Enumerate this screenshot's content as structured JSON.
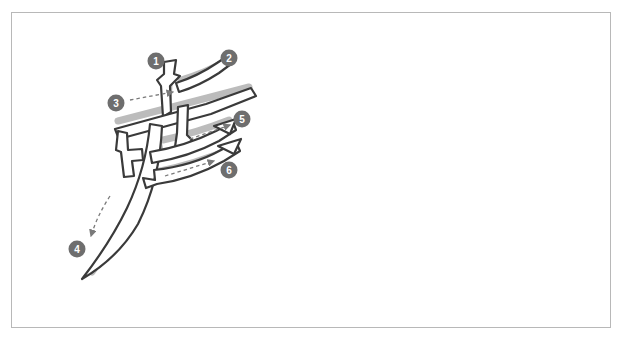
{
  "page": {
    "background_color": "#ffffff",
    "frame": {
      "border_color": "#b8b8b8",
      "fill_color": "#ffffff",
      "x": 11,
      "y": 12,
      "width": 600,
      "height": 316
    }
  },
  "diagram": {
    "type": "stroke-order-diagram",
    "character_form": "brush-outline calligraphic glyph",
    "stroke_count": 6,
    "stroke_outline_color": "#3a3a3a",
    "stroke_fill_color": "#ffffff",
    "stroke_shadow_color": "#9a9a9a",
    "arrow_color": "#7a7a7a",
    "arrow_style": "dashed",
    "markers": [
      {
        "id": "marker-1",
        "label": "1",
        "cx": 156,
        "cy": 61,
        "color": "#6e6e6e",
        "text_color": "#ffffff"
      },
      {
        "id": "marker-2",
        "label": "2",
        "cx": 229,
        "cy": 58,
        "color": "#6e6e6e",
        "text_color": "#ffffff"
      },
      {
        "id": "marker-3",
        "label": "3",
        "cx": 116,
        "cy": 103,
        "color": "#6e6e6e",
        "text_color": "#ffffff"
      },
      {
        "id": "marker-4",
        "label": "4",
        "cx": 77,
        "cy": 249,
        "color": "#6e6e6e",
        "text_color": "#ffffff"
      },
      {
        "id": "marker-5",
        "label": "5",
        "cx": 242,
        "cy": 119,
        "color": "#6e6e6e",
        "text_color": "#ffffff"
      },
      {
        "id": "marker-6",
        "label": "6",
        "cx": 229,
        "cy": 170,
        "color": "#6e6e6e",
        "text_color": "#ffffff"
      }
    ],
    "arrows": [
      {
        "id": "arrow-3",
        "from_x": 131,
        "from_y": 100,
        "to_x": 176,
        "to_y": 91,
        "head": "right"
      },
      {
        "id": "arrow-4",
        "from_x": 110,
        "from_y": 196,
        "to_x": 89,
        "to_y": 238,
        "head": "down-left-up"
      },
      {
        "id": "arrow-5",
        "from_x": 190,
        "from_y": 139,
        "to_x": 232,
        "to_y": 124,
        "head": "right-up"
      },
      {
        "id": "arrow-6",
        "from_x": 165,
        "from_y": 175,
        "to_x": 216,
        "to_y": 160,
        "head": "right-up"
      }
    ]
  }
}
